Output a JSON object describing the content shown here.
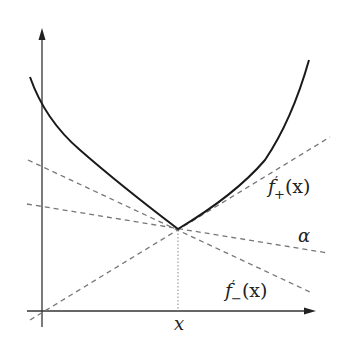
{
  "diagram": {
    "title": "",
    "colors": {
      "background": "#ffffff",
      "curve": "#1a1a1a",
      "axes": "#333333",
      "dashed_lines": "#777777",
      "dotted_guide": "#888888",
      "text": "#222222"
    },
    "labels": {
      "f_plus": "f′₊(x)",
      "f_plus_base": "f",
      "f_plus_prime": "′",
      "f_plus_sub": "+",
      "f_plus_arg": "(x)",
      "alpha": "α",
      "f_minus_base": "f",
      "f_minus_prime": "′",
      "f_minus_sub": "−",
      "f_minus_arg": "(x)",
      "x_tick": "x"
    },
    "geometry": {
      "kink": [
        178,
        229
      ],
      "y_axis": {
        "x": 42,
        "y_top": 28,
        "y_bottom": 327
      },
      "x_axis": {
        "y": 311,
        "x_left": 27,
        "x_right": 316
      }
    }
  }
}
